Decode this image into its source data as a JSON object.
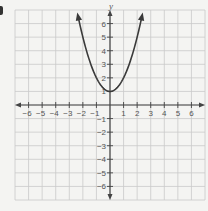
{
  "chart_data": {
    "type": "line",
    "title": "",
    "equation": "y = x^2 + 1",
    "xlabel": "",
    "ylabel": "y",
    "xlim": [
      -7,
      7
    ],
    "ylim": [
      -7,
      7
    ],
    "grid": true,
    "x_ticks": [
      -6,
      -5,
      -4,
      -3,
      -2,
      -1,
      1,
      2,
      3,
      4,
      5,
      6
    ],
    "y_ticks": [
      -6,
      -5,
      -4,
      -3,
      -2,
      -1,
      1,
      2,
      3,
      4,
      5,
      6
    ],
    "x_tick_labels": [
      "−6",
      "−5",
      "−4",
      "−3",
      "−2",
      "−1",
      "1",
      "2",
      "3",
      "4",
      "5",
      "6"
    ],
    "y_tick_labels": [
      "−6",
      "−5",
      "−4",
      "−3",
      "−2",
      "−1",
      "1",
      "2",
      "3",
      "4",
      "5",
      "6"
    ],
    "series": [
      {
        "name": "parabola",
        "x": [
          -2.35,
          -2,
          -1.5,
          -1,
          -0.5,
          0,
          0.5,
          1,
          1.5,
          2,
          2.35
        ],
        "y": [
          6.52,
          5,
          3.25,
          2,
          1.25,
          1,
          1.25,
          2,
          3.25,
          5,
          6.52
        ],
        "arrows_at_ends": true
      }
    ],
    "vertex": [
      0,
      1
    ]
  },
  "colors": {
    "background": "#f4f4f2",
    "grid": "#c9c9c9",
    "axis": "#444444",
    "curve": "#3a3a3a",
    "label": "#555555"
  }
}
